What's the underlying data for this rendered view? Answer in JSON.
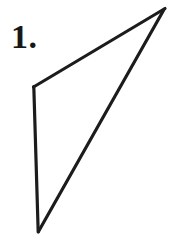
{
  "figure": {
    "label": "1.",
    "background_color": "#ffffff",
    "stroke_color": "#1c1c1c",
    "stroke_width": 3.2,
    "canvas": {
      "width": 177,
      "height": 236
    },
    "vertices": {
      "apex_top_right": {
        "x": 165,
        "y": 8
      },
      "corner_left": {
        "x": 33,
        "y": 87
      },
      "bottom": {
        "x": 38,
        "y": 232
      }
    },
    "edges": [
      {
        "name": "upper-left-edge",
        "from": "corner_left",
        "to": "apex_top_right",
        "path": "M 33 87 L 165 8"
      },
      {
        "name": "left-vertical-edge",
        "from": "corner_left",
        "to": "bottom",
        "path": "M 33 87 L 38 232"
      },
      {
        "name": "interior-diagonal",
        "from": "bottom",
        "to": "apex_top_right",
        "path": "M 38 232 L 163 10"
      },
      {
        "name": "right-edge",
        "from": "apex_top_right",
        "to": "bottom",
        "path": "M 166 10 L 39 233"
      }
    ]
  }
}
